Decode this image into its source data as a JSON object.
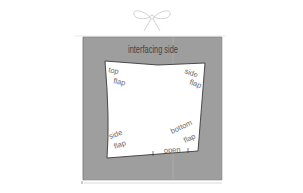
{
  "diagram": {
    "title": "interfacing side",
    "labels": {
      "top_flap_1": "top",
      "top_flap_2": "flap",
      "side_flap_right_1": "side",
      "side_flap_right_2": "flap",
      "side_flap_left_1": "side",
      "side_flap_left_2": "flap",
      "bottom_flap_1": "bottom",
      "bottom_flap_2": "flap",
      "open": "open"
    },
    "colors": {
      "background": "#ffffff",
      "grey_square": "#9e9e9e",
      "inner_panel": "#ffffff",
      "outline": "#3a3a3a",
      "frame_border": "#2e2e2e",
      "bow": "#c8c8c8"
    },
    "decorations": {
      "ribbon": "ribbon-bow-icon"
    }
  }
}
